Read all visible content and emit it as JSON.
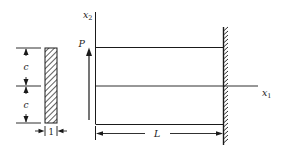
{
  "figure": {
    "cross_section": {
      "dimension_labels": [
        "c",
        "c"
      ],
      "thickness_label": "1"
    },
    "axes": {
      "vertical": {
        "base": "x",
        "subscript": "2"
      },
      "horizontal": {
        "base": "x",
        "subscript": "1"
      }
    },
    "load": {
      "label": "P",
      "direction": "up"
    },
    "length_label": "L",
    "support": "fixed-wall"
  },
  "colors": {
    "ink": "#1a1a1a",
    "background": "#ffffff"
  }
}
